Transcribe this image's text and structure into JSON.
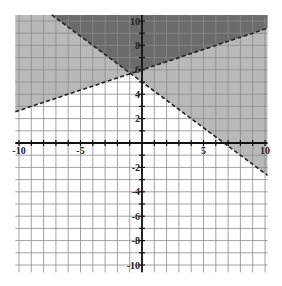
{
  "chart_data": {
    "type": "line",
    "title": "",
    "xlabel": "",
    "ylabel": "",
    "xlim": [
      -10.3,
      10.2
    ],
    "ylim": [
      -10.6,
      10.5
    ],
    "grid": true,
    "x_tick_labels": [
      "-10",
      "-5",
      "5",
      "10"
    ],
    "x_tick_values": [
      -10,
      -5,
      5,
      10
    ],
    "y_tick_labels": [
      "10",
      "8",
      "6",
      "4",
      "2",
      "-2",
      "-4",
      "-6",
      "-8",
      "-10"
    ],
    "y_tick_values": [
      10,
      8,
      6,
      4,
      2,
      -2,
      -4,
      -6,
      -8,
      -10
    ],
    "series": [
      {
        "name": "boundary-1",
        "equation": "y = (1/3)x + 6",
        "slope": 0.3333,
        "intercept": 6,
        "style": "dashed",
        "shade": "above"
      },
      {
        "name": "boundary-2",
        "equation": "y = -(3/4)x + 5",
        "slope": -0.75,
        "intercept": 5,
        "style": "dashed",
        "shade": "above"
      }
    ],
    "intersection": {
      "x": -0.92,
      "y": 5.69
    },
    "regions": [
      {
        "name": "overlap",
        "description": "above both lines",
        "color": "#6b6b6b"
      },
      {
        "name": "single",
        "description": "above exactly one line",
        "color": "#b9b9b9"
      },
      {
        "name": "none",
        "description": "below both lines",
        "color": "#ffffff"
      }
    ]
  },
  "colors": {
    "overlap": "#6b6b6b",
    "single": "#b9b9b9",
    "grid": "#8a8a8a",
    "axis": "#111111",
    "line": "#222222"
  }
}
